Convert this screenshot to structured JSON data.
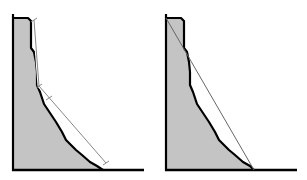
{
  "figure": {
    "panels": [
      {
        "id": "left",
        "description": "Stepped slope profile with two-segment dimension line",
        "fill_color": "#c4c4c4",
        "profile_color": "#000000",
        "guide_color": "#888888",
        "profile_points": "13,170 13,18 28,18 31,21 31,48 34,52 36,62 37,72 37,85 40,92 44,104 48,110 56,122 62,132 66,140 72,146 76,150 82,155 90,162 97,166 103,170",
        "guide_segments": [
          {
            "x1": 34,
            "y1": 20,
            "x2": 39,
            "y2": 86
          },
          {
            "x1": 39,
            "y1": 86,
            "x2": 106,
            "y2": 163
          }
        ],
        "ticks": [
          {
            "x": 34,
            "y": 20
          },
          {
            "x": 39,
            "y": 86
          },
          {
            "x": 49,
            "y": 98
          },
          {
            "x": 106,
            "y": 163
          }
        ]
      },
      {
        "id": "right",
        "description": "Same profile with single straight chord",
        "fill_color": "#c4c4c4",
        "profile_color": "#000000",
        "guide_color": "#666666",
        "profile_points": "13,170 13,18 28,18 31,21 31,48 34,52 36,62 37,72 37,85 40,92 44,104 48,110 56,122 62,132 66,140 72,146 76,150 82,155 90,162 97,166 101,170",
        "guide_segments": [
          {
            "x1": 13,
            "y1": 18,
            "x2": 101,
            "y2": 170
          }
        ],
        "ticks": []
      }
    ],
    "axes": {
      "axis_x_start": 13,
      "axis_x_end": 144,
      "baseline_y": 170,
      "axis_top_y": 14
    }
  }
}
